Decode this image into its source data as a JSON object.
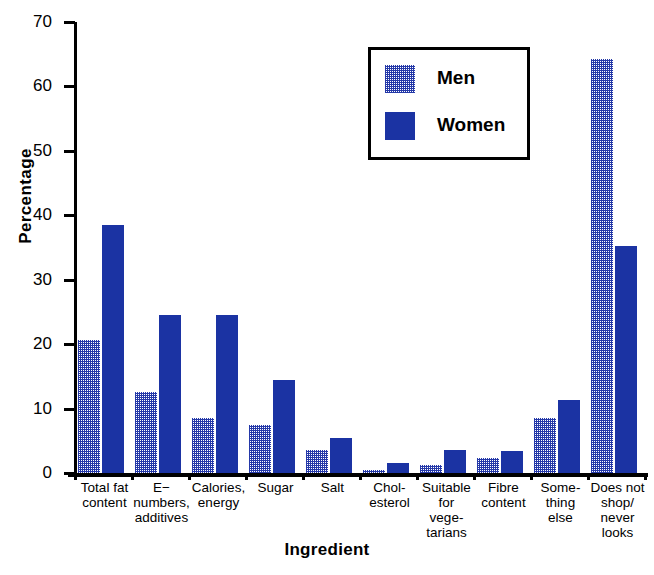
{
  "chart_data": {
    "type": "bar",
    "title": "",
    "xlabel": "Ingredient",
    "ylabel": "Percentage",
    "ylim": [
      0,
      70
    ],
    "yticks": [
      0,
      10,
      20,
      30,
      40,
      50,
      60,
      70
    ],
    "grid": false,
    "legend_position": "upper-center",
    "categories": [
      "Total fat content",
      "E−numbers, additives",
      "Calories, energy",
      "Sugar",
      "Salt",
      "Chol-esterol",
      "Suitable for vege-tarians",
      "Fibre content",
      "Some-thing else",
      "Does not shop/ never looks"
    ],
    "category_lines": [
      [
        "Total fat",
        "content"
      ],
      [
        "E−",
        "numbers,",
        "additives"
      ],
      [
        "Calories,",
        "energy"
      ],
      [
        "Sugar"
      ],
      [
        "Salt"
      ],
      [
        "Chol-",
        "esterol"
      ],
      [
        "Suitable",
        "for",
        "vege-",
        "tarians"
      ],
      [
        "Fibre",
        "content"
      ],
      [
        "Some-",
        "thing",
        "else"
      ],
      [
        "Does not",
        "shop/",
        "never",
        "looks"
      ]
    ],
    "series": [
      {
        "name": "Men",
        "color": "#2438a8",
        "fill": "stippled",
        "values": [
          20.6,
          12.6,
          8.6,
          7.5,
          3.6,
          0.5,
          1.2,
          2.3,
          8.5,
          64.3
        ]
      },
      {
        "name": "Women",
        "color": "#1b33a3",
        "fill": "solid",
        "values": [
          38.5,
          24.5,
          24.5,
          14.5,
          5.5,
          1.5,
          3.5,
          3.4,
          11.4,
          35.3
        ]
      }
    ]
  },
  "axis": {
    "y_title": "Percentage",
    "x_title": "Ingredient",
    "y_tick_labels": [
      "70",
      "60",
      "50",
      "40",
      "30",
      "20",
      "10",
      "0"
    ]
  },
  "legend": {
    "items": [
      {
        "label": "Men"
      },
      {
        "label": "Women"
      }
    ]
  }
}
